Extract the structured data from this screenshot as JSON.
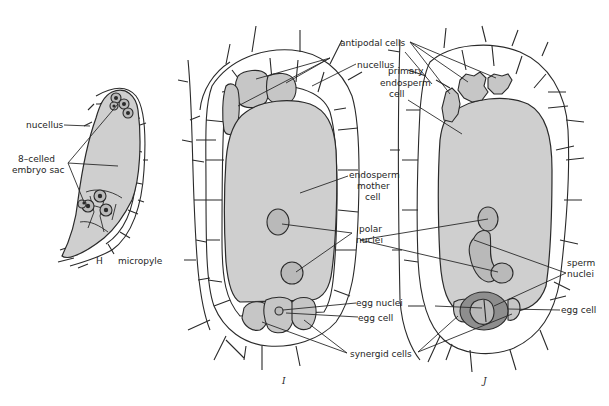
{
  "figure": {
    "panels": [
      {
        "id": "H",
        "caption": "H",
        "sublabel": "micropyle",
        "labels": {
          "nucellus": "nucellus",
          "embryo_sac_1": "8–celled",
          "embryo_sac_2": "embryo sac"
        }
      },
      {
        "id": "I",
        "caption": "I",
        "labels": {
          "antipodal": "antipodal cells",
          "nucellus": "nucellus",
          "endosperm_1": "endosperm",
          "endosperm_2": "mother",
          "endosperm_3": "cell",
          "polar_1": "polar",
          "polar_2": "nuclei",
          "egg_nuclei": "egg nuclei",
          "egg_cell": "egg cell",
          "synergid": "synergid cells"
        }
      },
      {
        "id": "J",
        "caption": "J",
        "labels": {
          "primary_1": "primary",
          "primary_2": "endosperm",
          "primary_3": "cell",
          "sperm_1": "sperm",
          "sperm_2": "nuclei",
          "egg_cell": "egg cell"
        }
      }
    ],
    "colors": {
      "line": "#2a2a2a",
      "sac_fill": "#cfcfcf",
      "cell_fill": "#c6c6c6",
      "egg_dark": "#8e8e8e",
      "background": "#ffffff"
    }
  }
}
